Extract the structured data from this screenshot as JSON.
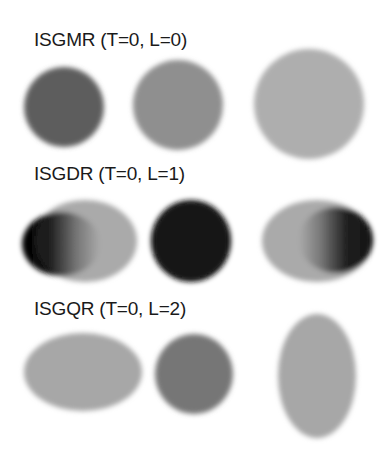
{
  "figure": {
    "rows": [
      {
        "title": "ISGMR (T=0, L=0)",
        "shapes": [
          {
            "kind": "circle",
            "cx": 64,
            "cy": 107,
            "rx": 40,
            "ry": 40,
            "fill": "#575757"
          },
          {
            "kind": "circle",
            "cx": 178,
            "cy": 105,
            "rx": 45,
            "ry": 45,
            "fill": "#8a8a8a"
          },
          {
            "kind": "circle",
            "cx": 309,
            "cy": 104,
            "rx": 55,
            "ry": 55,
            "fill": "#ababab"
          }
        ]
      },
      {
        "title": "ISGDR (T=0, L=1)",
        "shapes": [
          {
            "kind": "ellipse-gradient",
            "cx": 85,
            "cy": 241,
            "rx": 52,
            "ry": 41,
            "fill": "#a6a6a6",
            "inner": {
              "cx": 61,
              "cy": 244,
              "rx": 39,
              "ry": 32,
              "dark_side": "left"
            }
          },
          {
            "kind": "circle",
            "cx": 191,
            "cy": 241,
            "rx": 40,
            "ry": 41,
            "fill": "#050505"
          },
          {
            "kind": "ellipse-gradient",
            "cx": 317,
            "cy": 241,
            "rx": 55,
            "ry": 41,
            "fill": "#a6a6a6",
            "inner": {
              "cx": 336,
              "cy": 240,
              "rx": 37,
              "ry": 33,
              "dark_side": "right"
            }
          }
        ]
      },
      {
        "title": "ISGQR (T=0, L=2)",
        "shapes": [
          {
            "kind": "ellipse",
            "cx": 83,
            "cy": 372,
            "rx": 59,
            "ry": 39,
            "fill": "#a3a3a3"
          },
          {
            "kind": "circle",
            "cx": 194,
            "cy": 374,
            "rx": 39,
            "ry": 40,
            "fill": "#707070"
          },
          {
            "kind": "ellipse",
            "cx": 317,
            "cy": 376,
            "rx": 39,
            "ry": 62,
            "fill": "#a3a3a3"
          }
        ]
      }
    ]
  }
}
